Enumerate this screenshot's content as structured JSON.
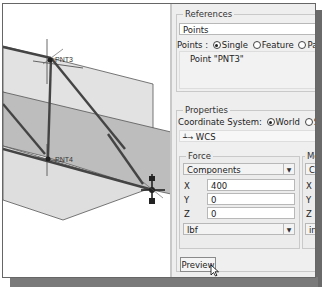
{
  "viewport": {
    "points": [
      {
        "label": "PNT3"
      },
      {
        "label": "PNT4"
      }
    ]
  },
  "panel": {
    "references": {
      "title": "References",
      "collector": "Points",
      "points_label": "Points :",
      "options": [
        "Single",
        "Feature",
        "Patte"
      ],
      "selected_option": "Single",
      "selected_item": "Point \"PNT3\""
    },
    "properties": {
      "title": "Properties",
      "coord_label": "Coordinate System:",
      "coord_options": [
        "World",
        "Select"
      ],
      "selected_coord": "World",
      "coord_value": "WCS"
    },
    "force": {
      "title": "Force",
      "mode": "Components",
      "x_label": "X",
      "x_value": "400",
      "y_label": "Y",
      "y_value": "0",
      "z_label": "Z",
      "z_value": "0",
      "units": "lbf"
    },
    "moment": {
      "title": "Mo",
      "mode": "Co",
      "x_label": "X",
      "y_label": "Y",
      "z_label": "Z",
      "units": "in"
    },
    "preview_label": "Preview"
  }
}
